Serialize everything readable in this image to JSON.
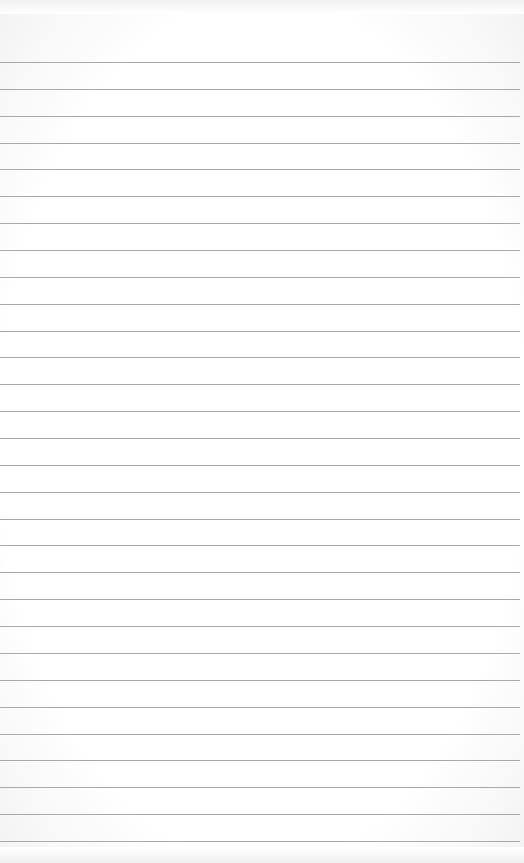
{
  "page": {
    "type": "blank-lined-paper",
    "background_color": "#ffffff",
    "line_color": "#a9a9a9",
    "line_count": 30,
    "first_line_y": 62,
    "line_spacing": 26.86,
    "text": ""
  }
}
